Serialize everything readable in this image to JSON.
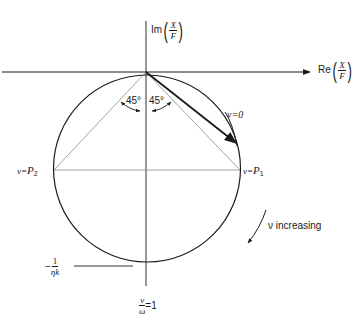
{
  "diagram": {
    "type": "polar-receptance-circle",
    "axes": {
      "imag_label_prefix": "Im",
      "real_label_prefix": "Re",
      "ratio_numerator": "X",
      "ratio_denominator": "F"
    },
    "angles": {
      "left": "45°",
      "right": "45°"
    },
    "points": {
      "start": "ν=0",
      "half_power_left_prefix": "ν=",
      "half_power_left_sym": "P",
      "half_power_left_sub": "2",
      "half_power_right_prefix": "ν=",
      "half_power_right_sym": "P",
      "half_power_right_sub": "1"
    },
    "direction": {
      "label": "ν increasing"
    },
    "min_value": {
      "sign": "−",
      "numerator": "1",
      "denominator": "ηk"
    },
    "resonance": {
      "numerator": "ν",
      "denominator": "ω",
      "value": "=1"
    },
    "colors": {
      "line": "#1a1a1a",
      "thin_line": "#8a8a8a",
      "background": "#ffffff"
    }
  }
}
